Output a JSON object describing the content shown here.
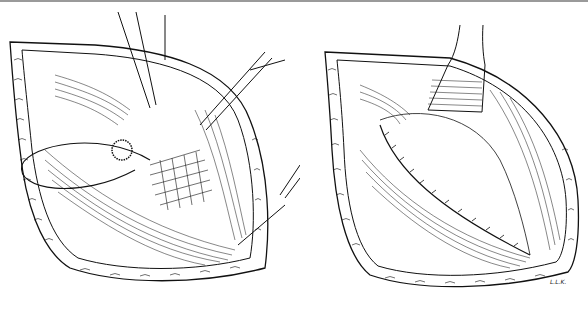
{
  "figure": {
    "panels": [
      {
        "id": "left",
        "content": "Open wound retracted with instruments, suture loop and mesh graft being placed"
      },
      {
        "id": "right",
        "content": "Wound after closure of inner layer with continuous suture line, single retractor"
      }
    ],
    "signature": "L.L.K.",
    "colors": {
      "ink": "#111111",
      "paper": "#ffffff",
      "border": "#9a9a9a"
    }
  }
}
